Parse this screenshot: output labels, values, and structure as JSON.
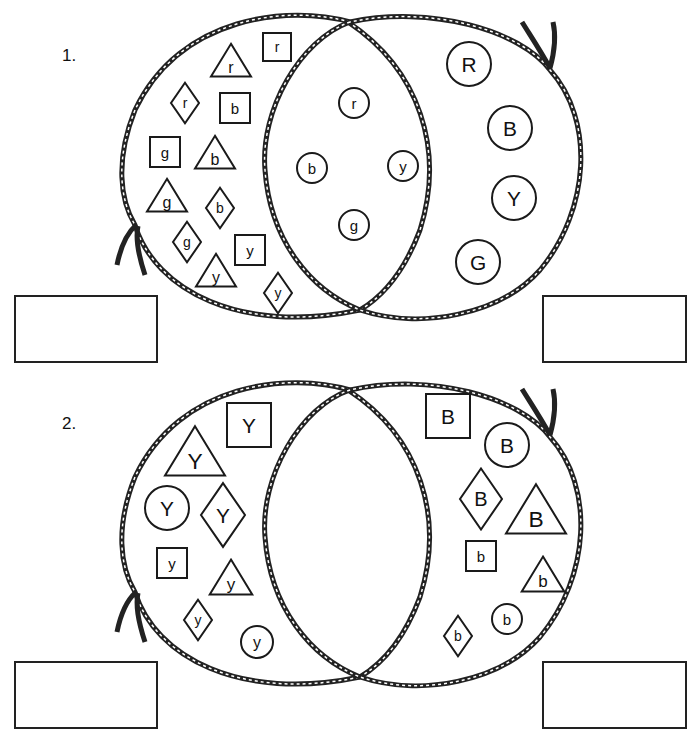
{
  "worksheet": {
    "problems": [
      {
        "number": "1.",
        "left_only": [
          {
            "shape": "triangle",
            "label": "r",
            "x": 231,
            "y": 63,
            "s": 16
          },
          {
            "shape": "square",
            "label": "r",
            "x": 277,
            "y": 47,
            "s": 14
          },
          {
            "shape": "diamond",
            "label": "r",
            "x": 185,
            "y": 103,
            "s": 14
          },
          {
            "shape": "square",
            "label": "b",
            "x": 235,
            "y": 108,
            "s": 15
          },
          {
            "shape": "square",
            "label": "g",
            "x": 165,
            "y": 152,
            "s": 15
          },
          {
            "shape": "triangle",
            "label": "b",
            "x": 215,
            "y": 155,
            "s": 16
          },
          {
            "shape": "diamond",
            "label": "b",
            "x": 220,
            "y": 208,
            "s": 14
          },
          {
            "shape": "triangle",
            "label": "g",
            "x": 167,
            "y": 198,
            "s": 16
          },
          {
            "shape": "diamond",
            "label": "g",
            "x": 187,
            "y": 242,
            "s": 14
          },
          {
            "shape": "square",
            "label": "y",
            "x": 250,
            "y": 250,
            "s": 15
          },
          {
            "shape": "triangle",
            "label": "y",
            "x": 216,
            "y": 273,
            "s": 16
          },
          {
            "shape": "diamond",
            "label": "y",
            "x": 278,
            "y": 293,
            "s": 14
          }
        ],
        "both": [
          {
            "shape": "circle",
            "label": "r",
            "x": 354,
            "y": 103,
            "s": 15
          },
          {
            "shape": "circle",
            "label": "b",
            "x": 312,
            "y": 168,
            "s": 15
          },
          {
            "shape": "circle",
            "label": "y",
            "x": 403,
            "y": 166,
            "s": 15
          },
          {
            "shape": "circle",
            "label": "g",
            "x": 354,
            "y": 225,
            "s": 15
          }
        ],
        "right_only": [
          {
            "shape": "circle",
            "label": "R",
            "x": 469,
            "y": 64,
            "s": 22
          },
          {
            "shape": "circle",
            "label": "B",
            "x": 510,
            "y": 128,
            "s": 22
          },
          {
            "shape": "circle",
            "label": "Y",
            "x": 514,
            "y": 198,
            "s": 22
          },
          {
            "shape": "circle",
            "label": "G",
            "x": 478,
            "y": 262,
            "s": 22
          }
        ],
        "answer_boxes": [
          {
            "value": ""
          },
          {
            "value": ""
          }
        ]
      },
      {
        "number": "2.",
        "left_only": [
          {
            "shape": "square",
            "label": "Y",
            "x": 249,
            "y": 425,
            "s": 22
          },
          {
            "shape": "triangle",
            "label": "Y",
            "x": 195,
            "y": 455,
            "s": 24
          },
          {
            "shape": "circle",
            "label": "Y",
            "x": 167,
            "y": 508,
            "s": 22
          },
          {
            "shape": "diamond",
            "label": "Y",
            "x": 223,
            "y": 515,
            "s": 22
          },
          {
            "shape": "square",
            "label": "y",
            "x": 172,
            "y": 563,
            "s": 15
          },
          {
            "shape": "triangle",
            "label": "y",
            "x": 231,
            "y": 580,
            "s": 17
          },
          {
            "shape": "diamond",
            "label": "y",
            "x": 198,
            "y": 620,
            "s": 14
          },
          {
            "shape": "circle",
            "label": "y",
            "x": 257,
            "y": 642,
            "s": 16
          }
        ],
        "both": [],
        "right_only": [
          {
            "shape": "square",
            "label": "B",
            "x": 448,
            "y": 416,
            "s": 22
          },
          {
            "shape": "circle",
            "label": "B",
            "x": 507,
            "y": 445,
            "s": 22
          },
          {
            "shape": "diamond",
            "label": "B",
            "x": 481,
            "y": 499,
            "s": 21
          },
          {
            "shape": "triangle",
            "label": "B",
            "x": 536,
            "y": 513,
            "s": 24
          },
          {
            "shape": "square",
            "label": "b",
            "x": 481,
            "y": 556,
            "s": 15
          },
          {
            "shape": "triangle",
            "label": "b",
            "x": 543,
            "y": 577,
            "s": 17
          },
          {
            "shape": "circle",
            "label": "b",
            "x": 507,
            "y": 619,
            "s": 15
          },
          {
            "shape": "diamond",
            "label": "b",
            "x": 458,
            "y": 636,
            "s": 14
          }
        ],
        "answer_boxes": [
          {
            "value": ""
          },
          {
            "value": ""
          }
        ]
      }
    ],
    "colors": {
      "ink": "#1a1a1a",
      "paper": "#ffffff"
    }
  }
}
